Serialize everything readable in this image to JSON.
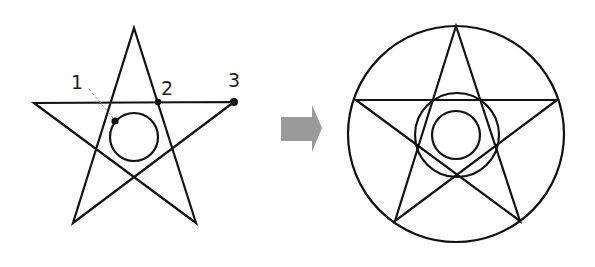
{
  "diagram": {
    "left_figure": {
      "description": "Pentagram with inner circle and three marked points",
      "stroke_color": "#111111",
      "star_points": [
        [
          134,
          28
        ],
        [
          196,
          223
        ],
        [
          34,
          103
        ],
        [
          234,
          102
        ],
        [
          73,
          223
        ]
      ],
      "circle": {
        "cx": 134,
        "cy": 137,
        "r": 24
      },
      "points": [
        {
          "label": "1",
          "x": 115,
          "y": 121,
          "label_x": 71,
          "label_y": 89
        },
        {
          "label": "2",
          "x": 158,
          "y": 102,
          "label_x": 161,
          "label_y": 95
        },
        {
          "label": "3",
          "x": 234,
          "y": 102,
          "label_x": 228,
          "label_y": 87
        }
      ],
      "leader_line": {
        "x1": 89,
        "y1": 89,
        "x2": 113,
        "y2": 118,
        "color": "#888888"
      }
    },
    "arrow": {
      "color": "#999999",
      "direction": "right"
    },
    "right_figure": {
      "description": "Pentagram inscribed in circle with two concentric inner circles",
      "stroke_color": "#111111",
      "outer_circle": {
        "cx": 456,
        "cy": 134,
        "r": 108
      },
      "star_points": [
        [
          456,
          26
        ],
        [
          520,
          221
        ],
        [
          356,
          100
        ],
        [
          557,
          100
        ],
        [
          395,
          221
        ]
      ],
      "middle_circle": {
        "cx": 457,
        "cy": 135,
        "r": 42
      },
      "inner_circle": {
        "cx": 456,
        "cy": 135,
        "r": 24
      }
    }
  }
}
